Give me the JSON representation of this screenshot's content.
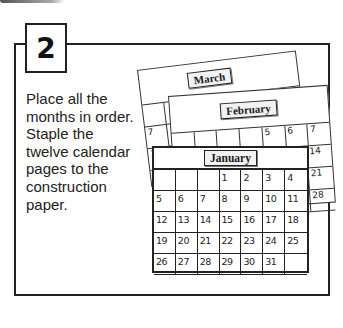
{
  "step": {
    "number": "2"
  },
  "instructions": {
    "text": "Place all the months in order. Staple the twelve calendar pages to the construction paper."
  },
  "calendar_pages": {
    "march": {
      "label": "March",
      "visible_left_dates": [
        "7",
        "14",
        "21",
        "28"
      ]
    },
    "february": {
      "label": "February",
      "visible_top_dates": [
        "5",
        "6",
        "7"
      ],
      "visible_right_dates": [
        "14",
        "21",
        "28"
      ]
    },
    "january": {
      "label": "January",
      "weeks": [
        [
          "",
          "",
          "",
          "1",
          "2",
          "3",
          "4"
        ],
        [
          "5",
          "6",
          "7",
          "8",
          "9",
          "10",
          "11"
        ],
        [
          "12",
          "13",
          "14",
          "15",
          "16",
          "17",
          "18"
        ],
        [
          "19",
          "20",
          "21",
          "22",
          "23",
          "24",
          "25"
        ],
        [
          "26",
          "27",
          "28",
          "29",
          "30",
          "31",
          ""
        ]
      ]
    }
  }
}
